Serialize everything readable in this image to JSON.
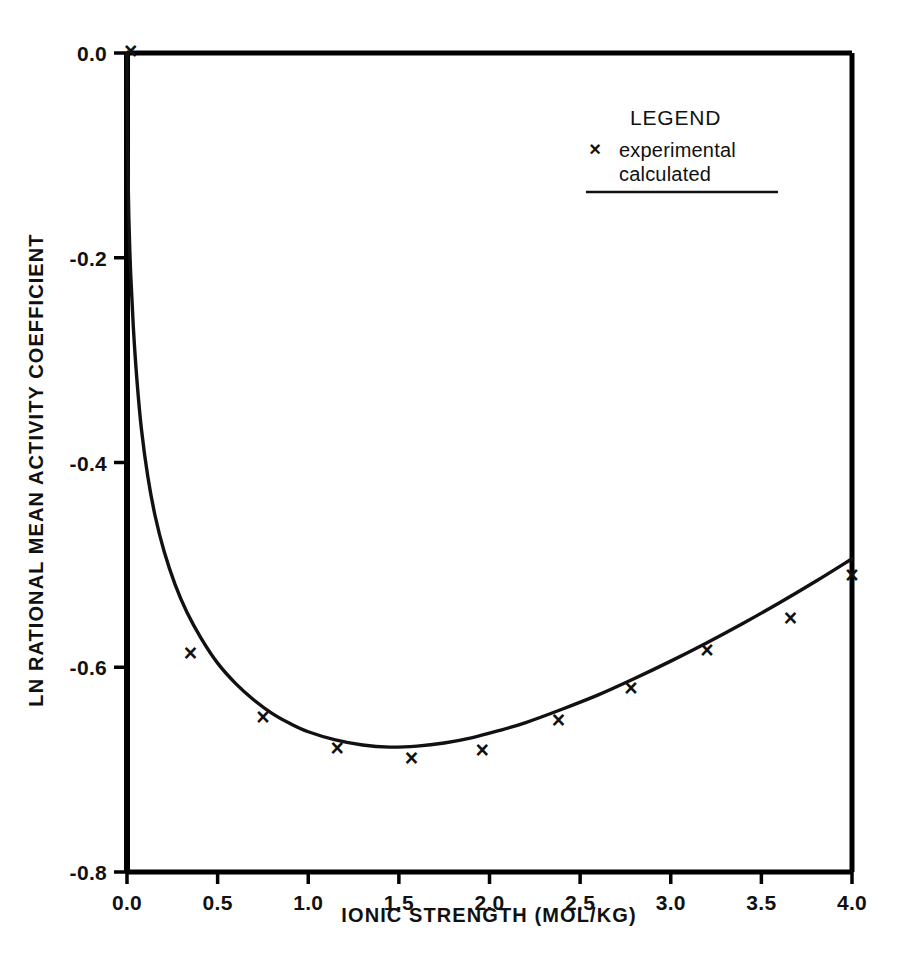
{
  "chart_data": {
    "type": "scatter",
    "title": "",
    "xlabel": "IONIC STRENGTH (MOL/KG)",
    "ylabel": "LN RATIONAL MEAN ACTIVITY COEFFICIENT",
    "xlim": [
      0.0,
      4.0
    ],
    "ylim": [
      -0.8,
      0.0
    ],
    "grid": false,
    "xticks": [
      "0.0",
      "0.5",
      "1.0",
      "1.5",
      "2.0",
      "2.5",
      "3.0",
      "3.5",
      "4.0"
    ],
    "xtick_values": [
      0.0,
      0.5,
      1.0,
      1.5,
      2.0,
      2.5,
      3.0,
      3.5,
      4.0
    ],
    "yticks": [
      "0.0",
      "-0.2",
      "-0.4",
      "-0.6",
      "-0.8"
    ],
    "ytick_values": [
      0.0,
      -0.2,
      -0.4,
      -0.6,
      -0.8
    ],
    "legend": {
      "position": "top-right",
      "heading": "LEGEND",
      "entries": [
        {
          "marker": "×",
          "label": "experimental",
          "style": "points"
        },
        {
          "marker": "",
          "label": "calculated",
          "style": "line"
        }
      ]
    },
    "series": [
      {
        "name": "experimental",
        "marker": "x",
        "type": "scatter",
        "points": [
          {
            "x": 0.02,
            "y": 0.0
          },
          {
            "x": 0.35,
            "y": -0.588
          },
          {
            "x": 0.75,
            "y": -0.65
          },
          {
            "x": 1.16,
            "y": -0.681
          },
          {
            "x": 1.57,
            "y": -0.691
          },
          {
            "x": 1.96,
            "y": -0.683
          },
          {
            "x": 2.38,
            "y": -0.653
          },
          {
            "x": 2.78,
            "y": -0.622
          },
          {
            "x": 3.2,
            "y": -0.585
          },
          {
            "x": 3.66,
            "y": -0.554
          },
          {
            "x": 4.0,
            "y": -0.512
          }
        ]
      },
      {
        "name": "calculated",
        "type": "line",
        "points": [
          {
            "x": 0.0,
            "y": 0.0
          },
          {
            "x": 0.002,
            "y": -0.06
          },
          {
            "x": 0.005,
            "y": -0.11
          },
          {
            "x": 0.01,
            "y": -0.16
          },
          {
            "x": 0.02,
            "y": -0.215
          },
          {
            "x": 0.035,
            "y": -0.268
          },
          {
            "x": 0.055,
            "y": -0.32
          },
          {
            "x": 0.08,
            "y": -0.368
          },
          {
            "x": 0.115,
            "y": -0.414
          },
          {
            "x": 0.155,
            "y": -0.452
          },
          {
            "x": 0.205,
            "y": -0.487
          },
          {
            "x": 0.265,
            "y": -0.519
          },
          {
            "x": 0.33,
            "y": -0.546
          },
          {
            "x": 0.41,
            "y": -0.572
          },
          {
            "x": 0.5,
            "y": -0.596
          },
          {
            "x": 0.6,
            "y": -0.616
          },
          {
            "x": 0.7,
            "y": -0.632
          },
          {
            "x": 0.8,
            "y": -0.645
          },
          {
            "x": 0.9,
            "y": -0.655
          },
          {
            "x": 1.0,
            "y": -0.663
          },
          {
            "x": 1.15,
            "y": -0.671
          },
          {
            "x": 1.3,
            "y": -0.676
          },
          {
            "x": 1.45,
            "y": -0.678
          },
          {
            "x": 1.6,
            "y": -0.677
          },
          {
            "x": 1.75,
            "y": -0.674
          },
          {
            "x": 1.9,
            "y": -0.669
          },
          {
            "x": 2.05,
            "y": -0.662
          },
          {
            "x": 2.2,
            "y": -0.654
          },
          {
            "x": 2.4,
            "y": -0.641
          },
          {
            "x": 2.6,
            "y": -0.627
          },
          {
            "x": 2.8,
            "y": -0.611
          },
          {
            "x": 3.0,
            "y": -0.594
          },
          {
            "x": 3.2,
            "y": -0.576
          },
          {
            "x": 3.4,
            "y": -0.557
          },
          {
            "x": 3.6,
            "y": -0.537
          },
          {
            "x": 3.8,
            "y": -0.516
          },
          {
            "x": 4.0,
            "y": -0.494
          }
        ]
      }
    ]
  },
  "colors": {
    "ink": "#111111",
    "background": "#ffffff",
    "axis": "#000000"
  }
}
